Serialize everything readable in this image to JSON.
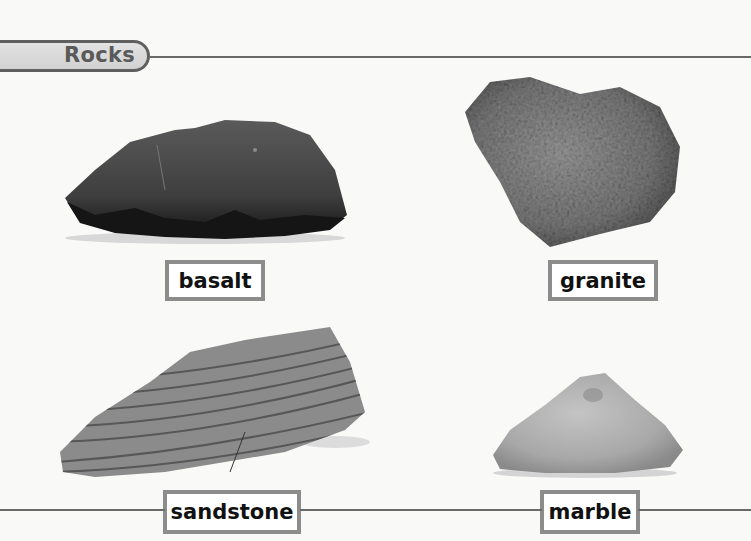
{
  "section": {
    "title": "Rocks"
  },
  "colors": {
    "rule": "#6a6a6a",
    "tab_fill": "#d8d8d8",
    "tab_border": "#5f5f5f",
    "label_border": "#8c8c8c",
    "label_text": "#111111"
  },
  "rocks": [
    {
      "name": "basalt",
      "label": "basalt",
      "icon": "basalt-rock-image"
    },
    {
      "name": "granite",
      "label": "granite",
      "icon": "granite-rock-image"
    },
    {
      "name": "sandstone",
      "label": "sandstone",
      "icon": "sandstone-rock-image"
    },
    {
      "name": "marble",
      "label": "marble",
      "icon": "marble-rock-image"
    }
  ]
}
